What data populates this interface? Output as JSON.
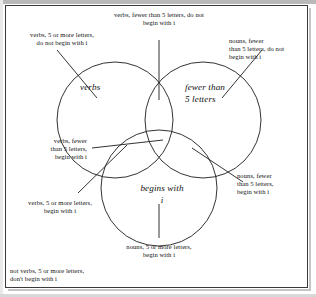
{
  "figure": {
    "type": "venn-diagram-3-set",
    "title_visible": false,
    "border_color": "#3a3a3a",
    "stroke_color": "#1c1c1c",
    "background": "#ffffff"
  },
  "sets": [
    {
      "id": "verbs",
      "name": "verbs",
      "label_lines": [
        "verbs"
      ],
      "position": "top-left"
    },
    {
      "id": "fewer-than-5-letters",
      "name": "fewer than 5 letters",
      "label_lines": [
        "fewer than",
        "5 letters"
      ],
      "position": "top-right"
    },
    {
      "id": "begins-with-i",
      "name": "begins with i",
      "label_lines": [
        "begins with",
        "i"
      ],
      "position": "bottom-center"
    }
  ],
  "regions": [
    {
      "id": "verbs-only",
      "text": "verbs, 5 or more letters,\ndo not begin with i",
      "sets_in": [
        "verbs"
      ],
      "sets_out": [
        "fewer than 5 letters",
        "begins with i"
      ],
      "label_position": "top-left-outside"
    },
    {
      "id": "verbs-and-fewer",
      "text": "verbs, fewer than 5 letters, do not\nbegin with i",
      "sets_in": [
        "verbs",
        "fewer than 5 letters"
      ],
      "sets_out": [
        "begins with i"
      ],
      "label_position": "top-center-outside"
    },
    {
      "id": "fewer-only",
      "text": "nouns, fewer\nthan 5 letters, do not\nbegin with i",
      "sets_in": [
        "fewer than 5 letters"
      ],
      "sets_out": [
        "verbs",
        "begins with i"
      ],
      "label_position": "top-right-outside"
    },
    {
      "id": "verbs-and-i",
      "text": "verbs, fewer\nthan 5 letters,\nbegin with i",
      "sets_in": [
        "verbs",
        "fewer than 5 letters",
        "begins with i"
      ],
      "sets_out": [],
      "label_position": "left-middle-outside"
    },
    {
      "id": "verbs-i-only",
      "text": "verbs, 5 or more letters,\nbegin with i",
      "sets_in": [
        "verbs",
        "begins with i"
      ],
      "sets_out": [
        "fewer than 5 letters"
      ],
      "label_position": "lower-left-outside"
    },
    {
      "id": "fewer-and-i",
      "text": "nouns, fewer\nthan 5 letters,\nbegin with i",
      "sets_in": [
        "fewer than 5 letters",
        "begins with i"
      ],
      "sets_out": [
        "verbs"
      ],
      "label_position": "right-middle-outside"
    },
    {
      "id": "i-only",
      "text": "nouns, 5 or more letters,\nbegin with i",
      "sets_in": [
        "begins with i"
      ],
      "sets_out": [
        "verbs",
        "fewer than 5 letters"
      ],
      "label_position": "bottom-center-outside"
    },
    {
      "id": "universe-only",
      "text": "not verbs, 5 or more letters,\ndon't begin with i",
      "sets_in": [],
      "sets_out": [
        "verbs",
        "fewer than 5 letters",
        "begins with i"
      ],
      "label_position": "bottom-left-corner"
    }
  ]
}
